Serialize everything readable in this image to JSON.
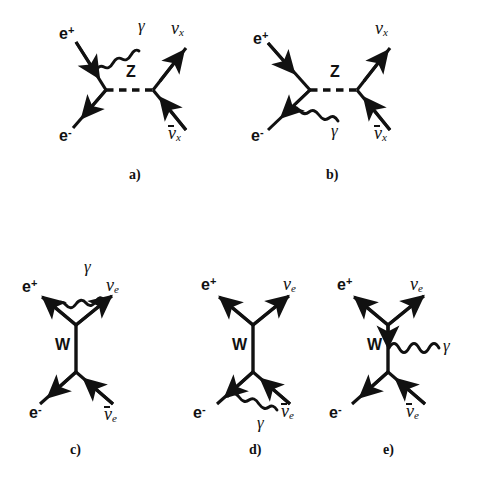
{
  "figure": {
    "background_color": "#ffffff",
    "ink_color": "#111111"
  },
  "particles": {
    "positron": "e",
    "positron_sup": "+",
    "electron": "e",
    "electron_sup": "-",
    "photon": "γ",
    "neutrino": "ν",
    "neutrino_x_sub": "x",
    "neutrino_e_sub": "e",
    "z_boson": "Z",
    "w_boson": "W"
  },
  "diagrams": [
    {
      "id": "a",
      "caption": "a)",
      "caption_pos": {
        "x": 129,
        "y": 168
      },
      "propagator": "Z",
      "propagator_style": "dashed-horizontal",
      "photon_from": "positron-leg",
      "labels": {
        "positron": {
          "x": 59,
          "y": 25
        },
        "electron": {
          "x": 59,
          "y": 127
        },
        "photon": {
          "x": 138,
          "y": 17
        },
        "neutrino_out": {
          "x": 171,
          "y": 19
        },
        "antineutrino_out": {
          "x": 168,
          "y": 124
        }
      }
    },
    {
      "id": "b",
      "caption": "b)",
      "caption_pos": {
        "x": 326,
        "y": 168
      },
      "propagator": "Z",
      "propagator_style": "dashed-horizontal",
      "photon_from": "electron-leg",
      "labels": {
        "positron": {
          "x": 253,
          "y": 30
        },
        "electron": {
          "x": 251,
          "y": 127
        },
        "photon": {
          "x": 331,
          "y": 122
        },
        "neutrino_out": {
          "x": 375,
          "y": 19
        },
        "antineutrino_out": {
          "x": 374,
          "y": 124
        }
      }
    },
    {
      "id": "c",
      "caption": "c)",
      "caption_pos": {
        "x": 70,
        "y": 443
      },
      "propagator": "W",
      "propagator_style": "solid-vertical",
      "photon_from": "positron-leg",
      "labels": {
        "positron": {
          "x": 22,
          "y": 278
        },
        "electron": {
          "x": 29,
          "y": 404
        },
        "photon": {
          "x": 84,
          "y": 258
        },
        "neutrino_out": {
          "x": 106,
          "y": 276
        },
        "antineutrino_out": {
          "x": 104,
          "y": 405
        },
        "boson": {
          "x": 55,
          "y": 337
        }
      }
    },
    {
      "id": "d",
      "caption": "d)",
      "caption_pos": {
        "x": 249,
        "y": 443
      },
      "propagator": "W",
      "propagator_style": "solid-vertical",
      "photon_from": "electron-leg",
      "labels": {
        "positron": {
          "x": 201,
          "y": 276
        },
        "electron": {
          "x": 193,
          "y": 404
        },
        "photon": {
          "x": 257,
          "y": 414
        },
        "neutrino_out": {
          "x": 283,
          "y": 275
        },
        "antineutrino_out": {
          "x": 281,
          "y": 402
        },
        "boson": {
          "x": 232,
          "y": 337
        }
      }
    },
    {
      "id": "e",
      "caption": "e)",
      "caption_pos": {
        "x": 383,
        "y": 443
      },
      "propagator": "W",
      "propagator_style": "solid-vertical",
      "photon_from": "w-propagator",
      "labels": {
        "positron": {
          "x": 337,
          "y": 276
        },
        "electron": {
          "x": 329,
          "y": 404
        },
        "photon": {
          "x": 443,
          "y": 337
        },
        "neutrino_out": {
          "x": 410,
          "y": 275
        },
        "antineutrino_out": {
          "x": 406,
          "y": 402
        },
        "boson": {
          "x": 367,
          "y": 337
        }
      }
    }
  ]
}
